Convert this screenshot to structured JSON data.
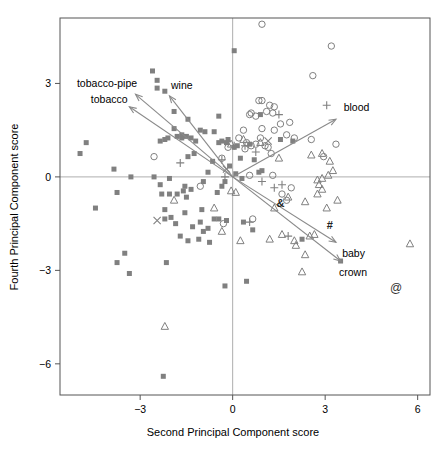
{
  "chart_data": {
    "type": "scatter",
    "title": "",
    "xlabel": "Second Principal Component score",
    "ylabel": "Fourth Principal Component score",
    "xlim": [
      -5.6,
      6.4
    ],
    "ylim": [
      -7.0,
      5.1
    ],
    "xticks": [
      -3,
      0,
      3,
      6
    ],
    "xticklabels": [
      "−3",
      "0",
      "3",
      "6"
    ],
    "yticks": [
      3,
      0,
      -3,
      -6
    ],
    "yticklabels": [
      "3",
      "0",
      "−3",
      "−6"
    ],
    "grid": false,
    "legend_position": "none",
    "reference_lines": [
      {
        "name": "x-zero-line",
        "orientation": "vertical",
        "value": 0
      },
      {
        "name": "y-zero-line",
        "orientation": "horizontal",
        "value": 0
      }
    ],
    "marker_color": "#808080",
    "arrow_color": "#8a8a8a",
    "axis_color": "#555555",
    "series": [
      {
        "name": "filled-square",
        "marker": "square-filled",
        "points": [
          [
            -2.6,
            3.4
          ],
          [
            -2.45,
            3.1
          ],
          [
            -2.2,
            2.75
          ],
          [
            -1.9,
            2.1
          ],
          [
            -2.45,
            2.85
          ],
          [
            -1.45,
            1.85
          ],
          [
            -1.65,
            1.35
          ],
          [
            -1.8,
            1.3
          ],
          [
            -1.65,
            1.25
          ],
          [
            -1.5,
            1.3
          ],
          [
            -1.35,
            1.25
          ],
          [
            -1.2,
            1.15
          ],
          [
            -2.1,
            1.25
          ],
          [
            -2.2,
            1.2
          ],
          [
            -2.35,
            1.15
          ],
          [
            -1.05,
            1.5
          ],
          [
            -0.9,
            1.45
          ],
          [
            -1.25,
            0.75
          ],
          [
            -1.45,
            0.65
          ],
          [
            -0.45,
            1.1
          ],
          [
            -0.35,
            1.15
          ],
          [
            -0.2,
            1.1
          ],
          [
            -0.15,
            1.2
          ],
          [
            0.05,
            0.95
          ],
          [
            0.15,
            1.0
          ],
          [
            -4.95,
            0.75
          ],
          [
            -4.75,
            1.1
          ],
          [
            -3.85,
            0.25
          ],
          [
            -3.75,
            -0.5
          ],
          [
            -4.45,
            -1.0
          ],
          [
            -3.3,
            0.0
          ],
          [
            -2.55,
            0.0
          ],
          [
            -2.3,
            -0.55
          ],
          [
            -2.05,
            -0.55
          ],
          [
            -1.8,
            -0.55
          ],
          [
            -1.6,
            -0.45
          ],
          [
            -1.55,
            -0.3
          ],
          [
            -1.35,
            -0.4
          ],
          [
            -1.5,
            -0.65
          ],
          [
            -0.95,
            -0.15
          ],
          [
            -0.8,
            0.15
          ],
          [
            -0.65,
            0.5
          ],
          [
            -0.5,
            -0.5
          ],
          [
            -0.35,
            -0.3
          ],
          [
            -0.25,
            -0.15
          ],
          [
            -2.2,
            -1.35
          ],
          [
            -2.0,
            -1.3
          ],
          [
            -1.85,
            -1.5
          ],
          [
            -1.55,
            -1.15
          ],
          [
            -1.7,
            -1.9
          ],
          [
            -1.45,
            -2.05
          ],
          [
            -1.3,
            -1.6
          ],
          [
            -1.1,
            -2.0
          ],
          [
            -1.05,
            -1.45
          ],
          [
            -0.95,
            -1.75
          ],
          [
            -0.8,
            -1.65
          ],
          [
            -0.6,
            -1.35
          ],
          [
            -0.75,
            -2.1
          ],
          [
            -0.45,
            -1.35
          ],
          [
            -0.2,
            -1.4
          ],
          [
            -0.25,
            -3.5
          ],
          [
            0.45,
            -3.35
          ],
          [
            -2.25,
            -6.4
          ],
          [
            -3.5,
            -2.45
          ],
          [
            -3.75,
            -2.75
          ],
          [
            -3.35,
            -3.1
          ],
          [
            -2.15,
            -2.75
          ],
          [
            -2.2,
            -1.05
          ],
          [
            0.35,
            -1.45
          ],
          [
            0.65,
            -1.7
          ],
          [
            0.85,
            0.15
          ],
          [
            0.95,
            0.2
          ],
          [
            0.7,
            0.55
          ],
          [
            0.9,
            2.0
          ],
          [
            0.05,
            4.05
          ],
          [
            1.55,
            1.2
          ],
          [
            1.95,
            1.15
          ],
          [
            2.25,
            -2.0
          ],
          [
            3.5,
            -2.7
          ],
          [
            0.3,
            -0.05
          ],
          [
            0.1,
            0.1
          ],
          [
            -0.45,
            1.95
          ],
          [
            0.55,
            1.05
          ],
          [
            0.25,
            0.6
          ],
          [
            -0.1,
            0.35
          ],
          [
            -1.0,
            -1.05
          ],
          [
            -2.05,
            -0.05
          ],
          [
            -2.35,
            -0.25
          ],
          [
            -1.9,
            1.55
          ],
          [
            -0.6,
            1.45
          ]
        ]
      },
      {
        "name": "open-circle",
        "marker": "circle-open",
        "points": [
          [
            0.95,
            4.9
          ],
          [
            3.2,
            4.2
          ],
          [
            2.6,
            3.25
          ],
          [
            0.85,
            2.45
          ],
          [
            0.95,
            2.45
          ],
          [
            1.2,
            2.3
          ],
          [
            1.35,
            2.25
          ],
          [
            1.1,
            2.1
          ],
          [
            1.3,
            2.05
          ],
          [
            0.6,
            2.05
          ],
          [
            0.55,
            2.0
          ],
          [
            0.75,
            1.95
          ],
          [
            1.55,
            1.7
          ],
          [
            1.85,
            1.75
          ],
          [
            1.35,
            1.5
          ],
          [
            1.75,
            1.35
          ],
          [
            2.0,
            1.25
          ],
          [
            2.55,
            1.2
          ],
          [
            3.35,
            1.05
          ],
          [
            0.35,
            1.5
          ],
          [
            0.45,
            1.1
          ],
          [
            0.6,
            1.0
          ],
          [
            0.75,
            1.05
          ],
          [
            0.9,
            1.25
          ],
          [
            1.15,
            0.95
          ],
          [
            1.25,
            0.75
          ],
          [
            -0.15,
            0.95
          ],
          [
            -0.35,
            0.6
          ],
          [
            -2.55,
            0.65
          ],
          [
            -1.05,
            -0.3
          ],
          [
            -0.3,
            -1.5
          ],
          [
            0.65,
            -1.35
          ],
          [
            1.6,
            -0.55
          ],
          [
            1.9,
            -0.35
          ],
          [
            1.75,
            -0.75
          ],
          [
            2.95,
            0.65
          ],
          [
            1.3,
            0.05
          ],
          [
            0.55,
            0.05
          ],
          [
            0.4,
            0.9
          ],
          [
            0.2,
            1.25
          ],
          [
            0.95,
            1.55
          ],
          [
            1.05,
            1.0
          ]
        ]
      },
      {
        "name": "open-triangle",
        "marker": "triangle-open",
        "points": [
          [
            0.35,
            1.2
          ],
          [
            0.9,
            1.1
          ],
          [
            1.5,
            0.6
          ],
          [
            2.55,
            0.7
          ],
          [
            2.9,
            0.75
          ],
          [
            3.15,
            0.5
          ],
          [
            3.25,
            0.2
          ],
          [
            2.75,
            -0.1
          ],
          [
            2.8,
            -0.25
          ],
          [
            2.9,
            -0.4
          ],
          [
            2.75,
            -0.55
          ],
          [
            3.4,
            -0.75
          ],
          [
            3.05,
            -1.0
          ],
          [
            2.35,
            -0.8
          ],
          [
            1.8,
            -0.65
          ],
          [
            1.35,
            -1.0
          ],
          [
            1.6,
            -1.85
          ],
          [
            2.0,
            -2.05
          ],
          [
            2.05,
            -2.2
          ],
          [
            2.5,
            -1.9
          ],
          [
            2.65,
            -1.85
          ],
          [
            2.35,
            -2.5
          ],
          [
            2.25,
            -3.05
          ],
          [
            5.75,
            -2.15
          ],
          [
            -2.2,
            -4.8
          ],
          [
            -1.9,
            -0.75
          ],
          [
            -0.6,
            -1.0
          ],
          [
            -0.35,
            -1.75
          ],
          [
            -0.05,
            -0.45
          ],
          [
            0.1,
            -0.5
          ],
          [
            -0.05,
            1.05
          ],
          [
            1.2,
            -2.0
          ],
          [
            2.9,
            -0.05
          ],
          [
            3.1,
            0.05
          ],
          [
            0.25,
            -2.05
          ]
        ]
      },
      {
        "name": "plus",
        "marker": "plus",
        "points": [
          [
            3.05,
            2.3
          ],
          [
            1.5,
            2.0
          ],
          [
            0.05,
            1.0
          ],
          [
            0.75,
            0.8
          ],
          [
            -1.7,
            0.45
          ],
          [
            -0.25,
            0.0
          ],
          [
            0.95,
            -0.15
          ],
          [
            1.6,
            -0.25
          ],
          [
            1.35,
            -0.35
          ],
          [
            0.55,
            -1.45
          ],
          [
            1.8,
            -1.9
          ],
          [
            0.4,
            1.0
          ],
          [
            -0.35,
            0.55
          ]
        ]
      },
      {
        "name": "x-cross",
        "marker": "x",
        "points": [
          [
            -2.45,
            -1.4
          ],
          [
            1.15,
            1.15
          ],
          [
            -0.2,
            0.25
          ]
        ]
      },
      {
        "name": "at-symbol",
        "marker": "at",
        "points": [
          [
            5.3,
            -3.55
          ]
        ]
      }
    ],
    "vectors": [
      {
        "name": "tobacco-pipe",
        "label": "tobacco-pipe",
        "tip": [
          -3.15,
          2.65
        ],
        "label_x": -5.05,
        "label_y": 3.0,
        "anchor": "start"
      },
      {
        "name": "tobacco",
        "label": "tobacco",
        "tip": [
          -3.35,
          2.25
        ],
        "label_x": -4.6,
        "label_y": 2.5,
        "anchor": "start"
      },
      {
        "name": "wine",
        "label": "wine",
        "tip": [
          -2.05,
          2.6
        ],
        "label_x": -2.0,
        "label_y": 2.95,
        "anchor": "start"
      },
      {
        "name": "blood",
        "label": "blood",
        "tip": [
          3.35,
          1.85
        ],
        "label_x": 3.6,
        "label_y": 2.25,
        "anchor": "start"
      },
      {
        "name": "baby",
        "label": "baby",
        "tip": [
          3.35,
          -2.1
        ],
        "label_x": 3.55,
        "label_y": -2.45,
        "anchor": "start"
      },
      {
        "name": "crown",
        "label": "crown",
        "tip": [
          3.5,
          -2.7
        ],
        "label_x": 3.45,
        "label_y": -3.05,
        "anchor": "start"
      }
    ],
    "annotations": [
      {
        "name": "ampersand-annotation",
        "text": "&",
        "x": 1.55,
        "y": -0.85
      },
      {
        "name": "hash-annotation",
        "text": "#",
        "x": 3.15,
        "y": -1.55
      }
    ]
  }
}
